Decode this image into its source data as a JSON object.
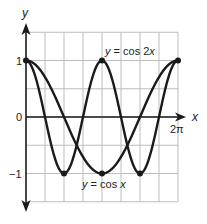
{
  "chart_data": {
    "type": "line",
    "title": "",
    "xlabel": "x",
    "ylabel": "y",
    "xlim": [
      0,
      6.2832
    ],
    "ylim": [
      -1.5,
      1.5
    ],
    "grid": true,
    "x_tick_labels": [
      {
        "value": 6.2832,
        "label": "2π"
      }
    ],
    "y_tick_labels": [
      {
        "value": 1,
        "label": "1"
      },
      {
        "value": 0,
        "label": "0"
      },
      {
        "value": -1,
        "label": "−1"
      }
    ],
    "series": [
      {
        "name": "y = cos 2x",
        "function": "cos(2x)",
        "key_points": [
          {
            "x": 0,
            "y": 1
          },
          {
            "x": 1.5708,
            "y": -1
          },
          {
            "x": 3.1416,
            "y": 1
          },
          {
            "x": 4.7124,
            "y": -1
          },
          {
            "x": 6.2832,
            "y": 1
          }
        ]
      },
      {
        "name": "y = cos x",
        "function": "cos(x)",
        "key_points": [
          {
            "x": 0,
            "y": 1
          },
          {
            "x": 3.1416,
            "y": -1
          },
          {
            "x": 6.2832,
            "y": 1
          }
        ]
      }
    ],
    "annotations": [
      {
        "text": "y = cos 2x",
        "near": "peak at x = π"
      },
      {
        "text": "y = cos x",
        "near": "trough at x = π"
      }
    ]
  },
  "labels": {
    "x_axis": "x",
    "y_axis": "y",
    "tick_2pi": "2π",
    "tick_1": "1",
    "tick_0": "0",
    "tick_neg1": "−1",
    "curve_cos2x_y": "y",
    "curve_cos2x_rest": " = cos 2",
    "curve_cos2x_x": "x",
    "curve_cosx_y": "y",
    "curve_cosx_rest": " = cos ",
    "curve_cosx_x": "x"
  },
  "colors": {
    "curve": "#1a1a1a",
    "grid": "#bdbdbd",
    "axis": "#1a1a1a"
  }
}
